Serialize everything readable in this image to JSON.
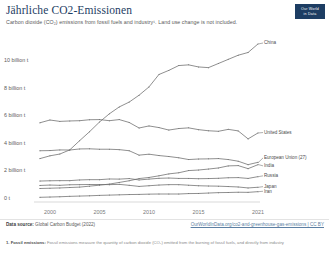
{
  "header": {
    "title": "Jährliche CO2-Emissionen",
    "subtitle": "Carbon dioxide (CO₂) emissions from fossil fuels and industry¹. Land use change is not included.",
    "badge_line1": "Our World",
    "badge_line2": "in Data"
  },
  "footer": {
    "source_label": "Data source:",
    "source_value": "Global Carbon Budget (2022)",
    "link": "OurWorldInData.org/co2-and-greenhouse-gas-emissions | CC BY",
    "note_label": "1. Fossil emissions:",
    "note_text": "Fossil emissions measure the quantity of carbon dioxide (CO₂) emitted from the burning of fossil fuels, and directly from industry"
  },
  "chart_data": {
    "type": "line",
    "title": "Jährliche CO2-Emissionen",
    "xlabel": "",
    "ylabel": "",
    "xlim": [
      1999,
      2021
    ],
    "ylim": [
      0,
      11.9
    ],
    "grid": false,
    "legend_position": "right-inline",
    "x_ticks": [
      "2000",
      "2005",
      "2010",
      "2015",
      "2021"
    ],
    "x_tick_values": [
      2000,
      2005,
      2010,
      2015,
      2021
    ],
    "y_ticks": [
      "0 t",
      "2 billion t",
      "4 billion t",
      "6 billion t",
      "8 billion t",
      "10 billion t"
    ],
    "y_tick_values": [
      0,
      2,
      4,
      6,
      8,
      10
    ],
    "unit": "billion tonnes",
    "x": [
      1999,
      2000,
      2001,
      2002,
      2003,
      2004,
      2005,
      2006,
      2007,
      2008,
      2009,
      2010,
      2011,
      2012,
      2013,
      2014,
      2015,
      2016,
      2017,
      2018,
      2019,
      2020,
      2021
    ],
    "series": [
      {
        "name": "China",
        "color": "#6b6b6b",
        "label_value": "China",
        "values": [
          3.15,
          3.35,
          3.48,
          3.78,
          4.45,
          5.1,
          5.8,
          6.4,
          6.9,
          7.25,
          7.75,
          8.35,
          9.25,
          9.55,
          9.9,
          9.95,
          9.8,
          9.75,
          10.05,
          10.35,
          10.65,
          10.85,
          11.47
        ]
      },
      {
        "name": "United States",
        "color": "#6b6b6b",
        "label_value": "United States",
        "values": [
          5.75,
          5.95,
          5.85,
          5.88,
          5.9,
          5.97,
          5.98,
          5.9,
          5.98,
          5.77,
          5.37,
          5.52,
          5.4,
          5.22,
          5.33,
          5.38,
          5.25,
          5.17,
          5.13,
          5.27,
          5.16,
          4.58,
          5.01
        ]
      },
      {
        "name": "European Union (27)",
        "color": "#6b6b6b",
        "label_value": "European Union (27)",
        "values": [
          3.72,
          3.73,
          3.78,
          3.77,
          3.85,
          3.86,
          3.83,
          3.83,
          3.8,
          3.72,
          3.4,
          3.47,
          3.37,
          3.3,
          3.21,
          3.08,
          3.12,
          3.13,
          3.15,
          3.08,
          2.96,
          2.71,
          2.88
        ]
      },
      {
        "name": "India",
        "color": "#6b6b6b",
        "label_value": "India",
        "values": [
          0.98,
          1.0,
          1.02,
          1.05,
          1.08,
          1.15,
          1.22,
          1.3,
          1.42,
          1.54,
          1.7,
          1.78,
          1.9,
          2.04,
          2.12,
          2.28,
          2.32,
          2.39,
          2.47,
          2.62,
          2.64,
          2.42,
          2.71
        ]
      },
      {
        "name": "Russia",
        "color": "#6b6b6b",
        "label_value": "Russia",
        "values": [
          1.52,
          1.54,
          1.55,
          1.55,
          1.6,
          1.62,
          1.62,
          1.67,
          1.66,
          1.7,
          1.6,
          1.66,
          1.72,
          1.74,
          1.71,
          1.71,
          1.69,
          1.7,
          1.72,
          1.76,
          1.77,
          1.71,
          1.84
        ]
      },
      {
        "name": "Japan",
        "color": "#6b6b6b",
        "label_value": "Japan",
        "values": [
          1.2,
          1.23,
          1.21,
          1.25,
          1.26,
          1.27,
          1.27,
          1.26,
          1.28,
          1.21,
          1.13,
          1.18,
          1.23,
          1.26,
          1.26,
          1.22,
          1.18,
          1.16,
          1.15,
          1.12,
          1.09,
          1.02,
          1.07
        ]
      },
      {
        "name": "Iran",
        "color": "#6b6b6b",
        "label_value": "Iran",
        "values": [
          0.34,
          0.36,
          0.38,
          0.41,
          0.43,
          0.45,
          0.48,
          0.5,
          0.52,
          0.54,
          0.55,
          0.57,
          0.58,
          0.58,
          0.58,
          0.61,
          0.62,
          0.65,
          0.68,
          0.69,
          0.71,
          0.7,
          0.75
        ]
      }
    ]
  }
}
